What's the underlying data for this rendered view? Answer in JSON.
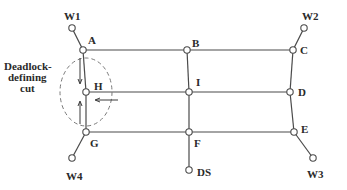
{
  "diagram": {
    "title": "",
    "cut_label": [
      "Deadlock-",
      "defining",
      "cut"
    ],
    "nodes": [
      {
        "id": "W1",
        "label": "W1",
        "x": 72,
        "y": 28,
        "lx": 64,
        "ly": 20
      },
      {
        "id": "A",
        "label": "A",
        "x": 83,
        "y": 50,
        "lx": 88,
        "ly": 44
      },
      {
        "id": "B",
        "label": "B",
        "x": 187,
        "y": 50,
        "lx": 192,
        "ly": 47
      },
      {
        "id": "C",
        "label": "C",
        "x": 293,
        "y": 50,
        "lx": 300,
        "ly": 54
      },
      {
        "id": "W2",
        "label": "W2",
        "x": 304,
        "y": 28,
        "lx": 302,
        "ly": 20
      },
      {
        "id": "H",
        "label": "H",
        "x": 86,
        "y": 92,
        "lx": 94,
        "ly": 90
      },
      {
        "id": "I",
        "label": "I",
        "x": 189,
        "y": 92,
        "lx": 196,
        "ly": 86
      },
      {
        "id": "D",
        "label": "D",
        "x": 290,
        "y": 92,
        "lx": 298,
        "ly": 96
      },
      {
        "id": "G",
        "label": "G",
        "x": 86,
        "y": 132,
        "lx": 90,
        "ly": 147
      },
      {
        "id": "F",
        "label": "F",
        "x": 189,
        "y": 132,
        "lx": 194,
        "ly": 147
      },
      {
        "id": "E",
        "label": "E",
        "x": 294,
        "y": 132,
        "lx": 301,
        "ly": 133
      },
      {
        "id": "W4",
        "label": "W4",
        "x": 72,
        "y": 158,
        "lx": 66,
        "ly": 180
      },
      {
        "id": "DS",
        "label": "DS",
        "x": 189,
        "y": 170,
        "lx": 197,
        "ly": 176
      },
      {
        "id": "W3",
        "label": "W3",
        "x": 313,
        "y": 158,
        "lx": 307,
        "ly": 178
      }
    ],
    "edges": [
      [
        "W1",
        "A"
      ],
      [
        "A",
        "B"
      ],
      [
        "B",
        "C"
      ],
      [
        "C",
        "W2"
      ],
      [
        "A",
        "H"
      ],
      [
        "H",
        "G"
      ],
      [
        "G",
        "W4"
      ],
      [
        "B",
        "I"
      ],
      [
        "I",
        "F"
      ],
      [
        "F",
        "DS"
      ],
      [
        "C",
        "D"
      ],
      [
        "D",
        "E"
      ],
      [
        "E",
        "W3"
      ],
      [
        "H",
        "I"
      ],
      [
        "I",
        "D"
      ],
      [
        "G",
        "F"
      ],
      [
        "F",
        "E"
      ]
    ]
  }
}
